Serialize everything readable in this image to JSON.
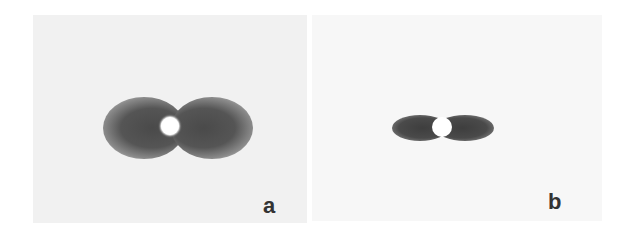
{
  "figure": {
    "panels": [
      {
        "id": "a",
        "label": "a",
        "description": "Broad dumbbell-shaped dark intensity pattern with bright central spot",
        "background_color": "#f1f1f1",
        "lobe_color": "#4a4a4a"
      },
      {
        "id": "b",
        "label": "b",
        "description": "Narrow, compact dumbbell-shaped dark intensity pattern with bright central spot",
        "background_color": "#f7f7f7",
        "lobe_color": "#3e3e3e"
      }
    ]
  }
}
